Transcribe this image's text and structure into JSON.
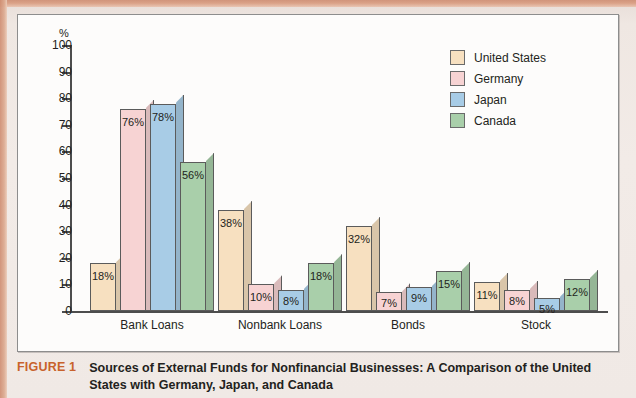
{
  "figure": {
    "tag": "FIGURE 1",
    "caption": "Sources of External Funds for Nonfinancial Businesses: A Comparison of the United States with Germany, Japan, and Canada"
  },
  "legend": {
    "position": "top-right",
    "items": [
      {
        "label": "United States",
        "color": "#f7e0c0"
      },
      {
        "label": "Germany",
        "color": "#f7d3d3"
      },
      {
        "label": "Japan",
        "color": "#a8cce6"
      },
      {
        "label": "Canada",
        "color": "#a9cfaa"
      }
    ]
  },
  "axes": {
    "y_unit": "%",
    "y_ticks": [
      "100",
      "90",
      "80",
      "70",
      "60",
      "50",
      "40",
      "30",
      "20",
      "10",
      "0"
    ]
  },
  "chart_data": {
    "type": "bar",
    "title": "Sources of External Funds for Nonfinancial Businesses: A Comparison of the United States with Germany, Japan, and Canada",
    "xlabel": "",
    "ylabel": "%",
    "ylim": [
      0,
      100
    ],
    "ytick_step": 10,
    "grid": false,
    "legend_position": "top-right",
    "categories": [
      "Bank Loans",
      "Nonbank Loans",
      "Bonds",
      "Stock"
    ],
    "series": [
      {
        "name": "United States",
        "color": "#f7e0c0",
        "values": [
          18,
          38,
          32,
          11
        ],
        "labels": [
          "18%",
          "38%",
          "32%",
          "11%"
        ]
      },
      {
        "name": "Germany",
        "color": "#f7d3d3",
        "values": [
          76,
          10,
          7,
          8
        ],
        "labels": [
          "76%",
          "10%",
          "7%",
          "8%"
        ]
      },
      {
        "name": "Japan",
        "color": "#a8cce6",
        "values": [
          78,
          8,
          9,
          5
        ],
        "labels": [
          "78%",
          "8%",
          "9%",
          "5%"
        ]
      },
      {
        "name": "Canada",
        "color": "#a9cfaa",
        "values": [
          56,
          18,
          15,
          12
        ],
        "labels": [
          "56%",
          "18%",
          "15%",
          "12%"
        ]
      }
    ]
  }
}
